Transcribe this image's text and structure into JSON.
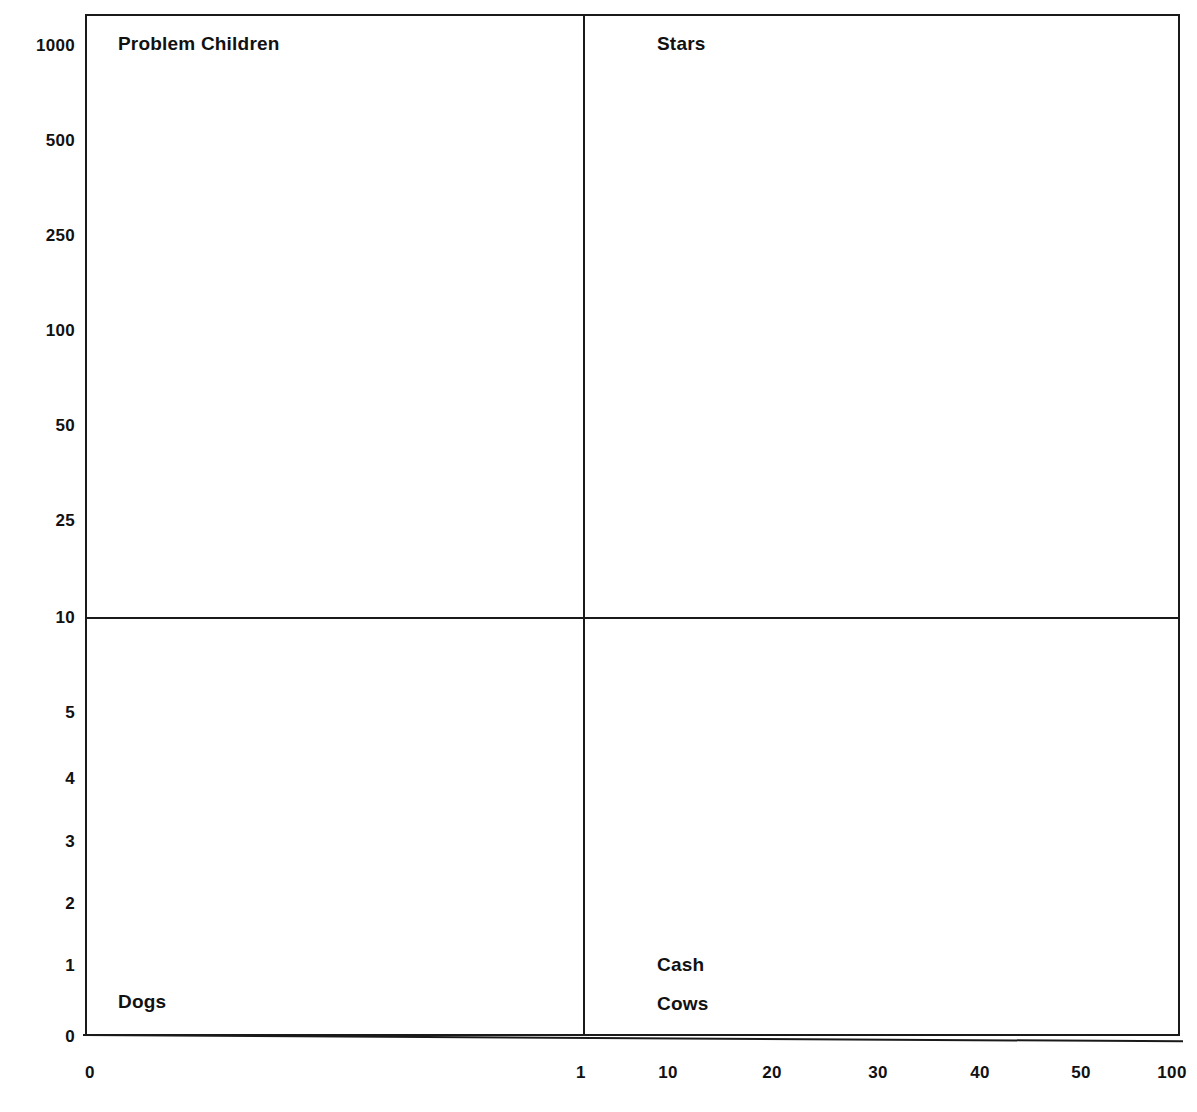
{
  "chart_data": {
    "type": "scatter",
    "title": "",
    "subtitle": "",
    "xlabel": "",
    "ylabel": "",
    "grid": false,
    "legend": "none",
    "annotations": [
      {
        "text": "Problem Children",
        "quadrant": "top-left"
      },
      {
        "text": "Stars",
        "quadrant": "top-right"
      },
      {
        "text": "Dogs",
        "quadrant": "bottom-left"
      },
      {
        "text": "Cash Cows",
        "quadrant": "bottom-right"
      }
    ],
    "x_ticks": [
      "0",
      "1",
      "10",
      "20",
      "30",
      "40",
      "50",
      "100"
    ],
    "y_ticks": [
      "1000",
      "500",
      "250",
      "100",
      "50",
      "25",
      "10",
      "5",
      "4",
      "3",
      "2",
      "1",
      "0"
    ],
    "x_divider": "1",
    "y_divider": "10",
    "series": [],
    "values": []
  },
  "quadrants": {
    "problem_children": {
      "label": "Problem Children"
    },
    "stars": {
      "label": "Stars"
    },
    "dogs": {
      "label": "Dogs"
    },
    "cash_cows": {
      "label_line1": "Cash",
      "label_line2": "Cows"
    }
  },
  "y_axis": {
    "ticks": [
      {
        "label": "1000",
        "y": 45
      },
      {
        "label": "500",
        "y": 140
      },
      {
        "label": "250",
        "y": 235
      },
      {
        "label": "100",
        "y": 330
      },
      {
        "label": "50",
        "y": 425
      },
      {
        "label": "25",
        "y": 520
      },
      {
        "label": "10",
        "y": 617
      },
      {
        "label": "5",
        "y": 712
      },
      {
        "label": "4",
        "y": 778
      },
      {
        "label": "3",
        "y": 841
      },
      {
        "label": "2",
        "y": 903
      },
      {
        "label": "1",
        "y": 965
      },
      {
        "label": "0",
        "y": 1036
      }
    ]
  },
  "x_axis": {
    "ticks": [
      {
        "label": "0",
        "x": 90
      },
      {
        "label": "1",
        "x": 581
      },
      {
        "label": "10",
        "x": 668
      },
      {
        "label": "20",
        "x": 772
      },
      {
        "label": "30",
        "x": 878
      },
      {
        "label": "40",
        "x": 980
      },
      {
        "label": "50",
        "x": 1081
      },
      {
        "label": "100",
        "x": 1172
      }
    ]
  },
  "colors": {
    "ink": "#1a1a1a",
    "text": "#111111",
    "background": "#ffffff"
  }
}
